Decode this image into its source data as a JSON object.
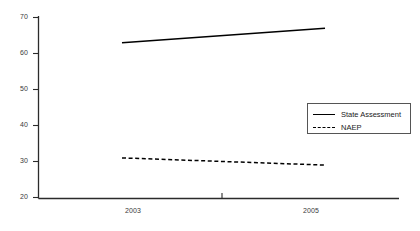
{
  "chart_data": {
    "type": "line",
    "title": "",
    "xlabel": "",
    "ylabel": "",
    "x": [
      "2003",
      "2005"
    ],
    "xtick_labels": [
      "2003",
      "2005"
    ],
    "ytick_labels": [
      "70",
      "60",
      "50",
      "40",
      "30",
      "20"
    ],
    "yticks": [
      70,
      60,
      50,
      40,
      30,
      20
    ],
    "ylim": [
      20,
      70
    ],
    "grid": false,
    "legend_position": "center-right",
    "series": [
      {
        "name": "State Assessment",
        "style": "solid",
        "color": "#000000",
        "values": [
          63,
          67
        ]
      },
      {
        "name": "NAEP",
        "style": "dashed",
        "color": "#000000",
        "values": [
          31,
          29
        ]
      }
    ]
  },
  "legend": {
    "entries": [
      {
        "label": "State Assessment",
        "key": "solid-line-key"
      },
      {
        "label": "NAEP",
        "key": "dashed-line-key"
      }
    ]
  }
}
